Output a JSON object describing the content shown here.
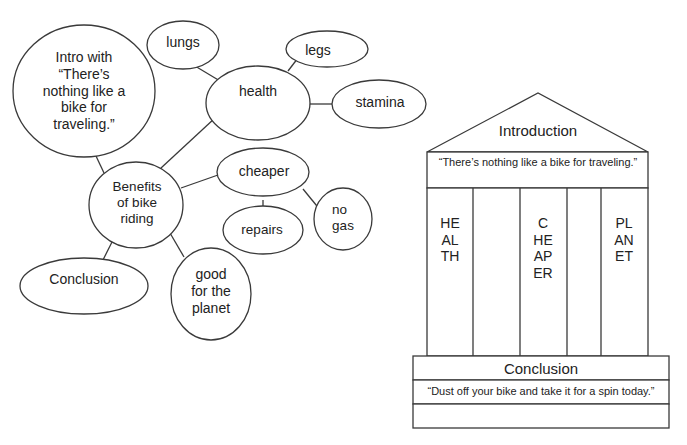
{
  "bubble_map": {
    "intro": {
      "line1": "Intro with",
      "line2": "“There’s",
      "line3": "nothing like a",
      "line4": "bike for",
      "line5": "traveling.”"
    },
    "center": {
      "line1": "Benefits",
      "line2": "of bike",
      "line3": "riding"
    },
    "health": "health",
    "lungs": "lungs",
    "legs": "legs",
    "stamina": "stamina",
    "cheaper": "cheaper",
    "repairs": "repairs",
    "no_gas": {
      "line1": "no",
      "line2": "gas"
    },
    "planet": {
      "line1": "good",
      "line2": "for the",
      "line3": "planet"
    },
    "conclusion": "Conclusion"
  },
  "temple": {
    "roof_label": "Introduction",
    "intro_quote": "“There’s nothing like a bike for traveling.”",
    "pillars": [
      "HEALTH",
      "CHEAPER",
      "PLANET"
    ],
    "base_label": "Conclusion",
    "conclusion_quote": "“Dust off your bike and take it for a spin today.”"
  },
  "colors": {
    "stroke": "#3a3a3a",
    "text": "#222222",
    "background": "#ffffff"
  }
}
